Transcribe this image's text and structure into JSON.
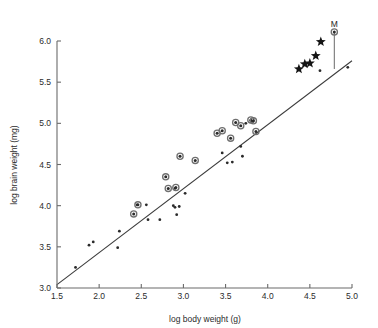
{
  "chart_data": {
    "type": "scatter",
    "title": "",
    "xlabel": "log body weight (g)",
    "ylabel": "log brain weight (mg)",
    "xlim": [
      1.5,
      5.0
    ],
    "ylim": [
      3.0,
      6.0
    ],
    "xticks": [
      "1.5",
      "2.0",
      "2.5",
      "3.0",
      "3.5",
      "4.0",
      "4.5",
      "5.0"
    ],
    "yticks": [
      "3.0",
      "3.5",
      "4.0",
      "4.5",
      "5.0",
      "5.5",
      "6.0"
    ],
    "grid": false,
    "legend": "none",
    "annotations": [
      {
        "text": "M",
        "x": 4.79,
        "y": 6.17
      }
    ],
    "fit_line": {
      "type": "line",
      "x0": 1.5,
      "y0": 3.04,
      "x1": 5.0,
      "y1": 5.76
    },
    "drop_line": {
      "x": 4.79,
      "y_top": 6.11,
      "y_bottom": 5.66
    },
    "series": [
      {
        "name": "minor points",
        "marker": "small-dot",
        "points": [
          [
            1.72,
            3.25
          ],
          [
            1.88,
            3.52
          ],
          [
            1.93,
            3.56
          ],
          [
            2.22,
            3.49
          ],
          [
            2.24,
            3.69
          ],
          [
            2.45,
            4.01
          ],
          [
            2.56,
            4.01
          ],
          [
            2.58,
            3.83
          ],
          [
            2.72,
            3.83
          ],
          [
            2.88,
            4.0
          ],
          [
            2.9,
            3.98
          ],
          [
            2.95,
            3.99
          ],
          [
            2.92,
            3.89
          ],
          [
            2.9,
            4.21
          ],
          [
            3.02,
            4.15
          ],
          [
            3.46,
            4.64
          ],
          [
            3.52,
            4.52
          ],
          [
            3.58,
            4.53
          ],
          [
            3.68,
            4.72
          ],
          [
            3.7,
            4.6
          ],
          [
            3.74,
            5.0
          ],
          [
            3.8,
            5.03
          ],
          [
            3.82,
            5.02
          ],
          [
            4.37,
            5.65
          ],
          [
            4.62,
            5.64
          ],
          [
            4.95,
            5.68
          ]
        ]
      },
      {
        "name": "major points",
        "marker": "ringed-dot",
        "points": [
          [
            2.41,
            3.9
          ],
          [
            2.46,
            4.01
          ],
          [
            2.79,
            4.35
          ],
          [
            2.82,
            4.21
          ],
          [
            2.91,
            4.22
          ],
          [
            2.96,
            4.6
          ],
          [
            3.14,
            4.55
          ],
          [
            3.4,
            4.88
          ],
          [
            3.46,
            4.91
          ],
          [
            3.56,
            4.82
          ],
          [
            3.62,
            5.01
          ],
          [
            3.68,
            4.97
          ],
          [
            3.8,
            5.04
          ],
          [
            3.83,
            5.03
          ],
          [
            3.86,
            4.9
          ],
          [
            4.79,
            6.11
          ]
        ]
      },
      {
        "name": "star points",
        "marker": "star",
        "points": [
          [
            4.37,
            5.66
          ],
          [
            4.44,
            5.72
          ],
          [
            4.5,
            5.73
          ],
          [
            4.57,
            5.82
          ],
          [
            4.63,
            5.99
          ]
        ]
      }
    ]
  }
}
